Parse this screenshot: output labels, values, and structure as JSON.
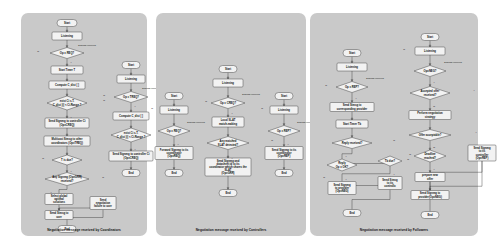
{
  "figure": {
    "background_color": "#ffffff",
    "panel_color": "#c9c9c9",
    "node_fill": "#f2f2f2",
    "node_stroke": "#3a3a3a"
  },
  "panels": [
    {
      "id": "coordinators",
      "caption": "Negotiation message received by Coordinators",
      "flows": [
        {
          "id": "coordinator-main",
          "nodes": [
            {
              "id": "c0",
              "type": "start",
              "label": "Start",
              "x": 46,
              "y": 10,
              "w": 20,
              "h": 7
            },
            {
              "id": "c1",
              "type": "process",
              "label": "Listening",
              "x": 46,
              "y": 23,
              "w": 30,
              "h": 8
            },
            {
              "id": "c2",
              "type": "decision",
              "label": "Op = REQ?",
              "x": 46,
              "y": 40,
              "w": 34,
              "h": 11
            },
            {
              "id": "c3",
              "type": "process",
              "label": "Start Timer T",
              "x": 46,
              "y": 57,
              "w": 32,
              "h": 8
            },
            {
              "id": "c4",
              "type": "process",
              "label": "Compute C_dist [ ]",
              "x": 46,
              "y": 72,
              "w": 36,
              "h": 8
            },
            {
              "id": "c5",
              "type": "decision",
              "label": "exist Ci s.T.\\nC_dist [i] < Ci.Range ?",
              "x": 46,
              "y": 90,
              "w": 40,
              "h": 14
            },
            {
              "id": "c6",
              "type": "process",
              "label": "Send Signmg to controller Ci\\n(Op=CREQ)",
              "x": 46,
              "y": 110,
              "w": 44,
              "h": 10
            },
            {
              "id": "c7",
              "type": "process",
              "label": "Multicast Simsg to other\\ncoordinators (Op=TREQ)",
              "x": 46,
              "y": 128,
              "w": 46,
              "h": 10
            },
            {
              "id": "c8",
              "type": "decision",
              "label": "T is due?",
              "x": 46,
              "y": 147,
              "w": 30,
              "h": 10
            },
            {
              "id": "c9",
              "type": "decision",
              "label": "Any Signmg (Op=GRR)\\nreceived?",
              "x": 46,
              "y": 166,
              "w": 44,
              "h": 13
            },
            {
              "id": "c10",
              "type": "process",
              "label": "Select global\\noptimal\\nsolutions",
              "x": 38,
              "y": 186,
              "w": 28,
              "h": 11
            },
            {
              "id": "c11",
              "type": "process",
              "label": "Send Simsg to\\nuser",
              "x": 38,
              "y": 202,
              "w": 28,
              "h": 9
            },
            {
              "id": "c12",
              "type": "process",
              "label": "Send\\nnegotiation\\nfailure to user",
              "x": 82,
              "y": 190,
              "w": 26,
              "h": 13
            },
            {
              "id": "c13",
              "type": "end",
              "label": "End",
              "x": 46,
              "y": 216,
              "w": 18,
              "h": 7
            }
          ],
          "edge_labels": [
            {
              "text": "Signmg received",
              "x": 66,
              "y": 33
            },
            {
              "text": "N",
              "x": 17,
              "y": 39
            },
            {
              "text": "Y",
              "x": 50,
              "y": 50
            },
            {
              "text": "Y",
              "x": 50,
              "y": 105
            },
            {
              "text": "N",
              "x": 83,
              "y": 88
            },
            {
              "text": "N",
              "x": 22,
              "y": 146
            },
            {
              "text": "Y",
              "x": 50,
              "y": 159
            },
            {
              "text": "Y",
              "x": 30,
              "y": 180
            },
            {
              "text": "N",
              "x": 82,
              "y": 165
            }
          ]
        },
        {
          "id": "coordinator-secondary",
          "nodes": [
            {
              "id": "d0",
              "type": "start",
              "label": "Start",
              "x": 110,
              "y": 52,
              "w": 18,
              "h": 7
            },
            {
              "id": "d1",
              "type": "process",
              "label": "Listening",
              "x": 110,
              "y": 66,
              "w": 28,
              "h": 8
            },
            {
              "id": "d2",
              "type": "decision",
              "label": "Op = TREQ?",
              "x": 110,
              "y": 84,
              "w": 34,
              "h": 11
            },
            {
              "id": "d3",
              "type": "process",
              "label": "Compute C_dist [ ]",
              "x": 110,
              "y": 103,
              "w": 36,
              "h": 8
            },
            {
              "id": "d4",
              "type": "decision",
              "label": "exist Ci s.T.\\nC_dist [i] < Ci.Range ?",
              "x": 110,
              "y": 122,
              "w": 40,
              "h": 14
            },
            {
              "id": "d5",
              "type": "process",
              "label": "Send Signmg to controller Ci\\n(Op=CREQ)",
              "x": 110,
              "y": 143,
              "w": 44,
              "h": 10
            },
            {
              "id": "d6",
              "type": "end",
              "label": "End",
              "x": 110,
              "y": 160,
              "w": 18,
              "h": 7
            }
          ],
          "edge_labels": [
            {
              "text": "Signmg received",
              "x": 130,
              "y": 76
            },
            {
              "text": "N",
              "x": 83,
              "y": 83
            },
            {
              "text": "Y",
              "x": 114,
              "y": 94
            },
            {
              "text": "Y",
              "x": 114,
              "y": 137
            },
            {
              "text": "N",
              "x": 146,
              "y": 120
            }
          ]
        }
      ]
    },
    {
      "id": "controllers",
      "caption": "Negotiation message received by Controllers",
      "flows": [
        {
          "id": "controller-left",
          "nodes": [
            {
              "id": "e0",
              "type": "start",
              "label": "Start",
              "x": 18,
              "y": 83,
              "w": 18,
              "h": 7
            },
            {
              "id": "e1",
              "type": "process",
              "label": "Listening",
              "x": 18,
              "y": 97,
              "w": 28,
              "h": 8
            },
            {
              "id": "e2",
              "type": "decision",
              "label": "Op = REQ?",
              "x": 18,
              "y": 118,
              "w": 32,
              "h": 11
            },
            {
              "id": "e3",
              "type": "process",
              "label": "Forward Signmg to its\\ncoordinator\\n(Op=REQ)",
              "x": 18,
              "y": 140,
              "w": 38,
              "h": 13
            },
            {
              "id": "e4",
              "type": "end",
              "label": "End",
              "x": 18,
              "y": 160,
              "w": 18,
              "h": 7
            }
          ],
          "edge_labels": [
            {
              "text": "Signmg received",
              "x": 40,
              "y": 110
            },
            {
              "text": "N",
              "x": -4,
              "y": 96
            },
            {
              "text": "Y",
              "x": 22,
              "y": 132
            }
          ]
        },
        {
          "id": "controller-center",
          "nodes": [
            {
              "id": "f0",
              "type": "start",
              "label": "Start",
              "x": 72,
              "y": 56,
              "w": 18,
              "h": 7
            },
            {
              "id": "f1",
              "type": "process",
              "label": "Listening",
              "x": 72,
              "y": 70,
              "w": 30,
              "h": 8
            },
            {
              "id": "f2",
              "type": "decision",
              "label": "Op = CREQ?",
              "x": 72,
              "y": 90,
              "w": 34,
              "h": 11
            },
            {
              "id": "f3",
              "type": "process",
              "label": "Local SLAT\\nmatch-making",
              "x": 72,
              "y": 109,
              "w": 32,
              "h": 10
            },
            {
              "id": "f4",
              "type": "decision",
              "label": "Any matched\\nSLAT detected?",
              "x": 72,
              "y": 130,
              "w": 42,
              "h": 13
            },
            {
              "id": "f5",
              "type": "process",
              "label": "Send Signmg and\\ndatasheet id to its\\ncoordinator which shares the\\nSLAT\\n(Op=GRR)",
              "x": 72,
              "y": 154,
              "w": 46,
              "h": 18
            },
            {
              "id": "f6",
              "type": "end",
              "label": "End",
              "x": 72,
              "y": 180,
              "w": 18,
              "h": 7
            }
          ],
          "edge_labels": [
            {
              "text": "Signmg received",
              "x": 95,
              "y": 82
            },
            {
              "text": "N",
              "x": 50,
              "y": 89
            },
            {
              "text": "Y",
              "x": 76,
              "y": 101
            },
            {
              "text": "Y",
              "x": 76,
              "y": 146
            },
            {
              "text": "N",
              "x": 116,
              "y": 128
            }
          ]
        },
        {
          "id": "controller-right",
          "nodes": [
            {
              "id": "g0",
              "type": "start",
              "label": "Start",
              "x": 128,
              "y": 83,
              "w": 18,
              "h": 7
            },
            {
              "id": "g1",
              "type": "process",
              "label": "Listening",
              "x": 128,
              "y": 97,
              "w": 28,
              "h": 8
            },
            {
              "id": "g2",
              "type": "decision",
              "label": "Op = REP?",
              "x": 128,
              "y": 118,
              "w": 32,
              "h": 11
            },
            {
              "id": "g3",
              "type": "process",
              "label": "Send Signmg to its\\ncoordinator\\n(Op=REP)",
              "x": 128,
              "y": 140,
              "w": 38,
              "h": 13
            },
            {
              "id": "g4",
              "type": "end",
              "label": "End",
              "x": 128,
              "y": 160,
              "w": 18,
              "h": 7
            }
          ],
          "edge_labels": [
            {
              "text": "Signmg received",
              "x": 150,
              "y": 110
            },
            {
              "text": "N",
              "x": 106,
              "y": 96
            },
            {
              "text": "Y",
              "x": 132,
              "y": 132
            }
          ]
        }
      ]
    },
    {
      "id": "followers",
      "caption": "Negotiation message received by Followers",
      "flows": [
        {
          "id": "follower-left",
          "nodes": [
            {
              "id": "h0",
              "type": "start",
              "label": "Start",
              "x": 42,
              "y": 40,
              "w": 18,
              "h": 7
            },
            {
              "id": "h1",
              "type": "process",
              "label": "Listening",
              "x": 42,
              "y": 54,
              "w": 30,
              "h": 8
            },
            {
              "id": "h2",
              "type": "decision",
              "label": "Op = REP?",
              "x": 42,
              "y": 74,
              "w": 32,
              "h": 11
            },
            {
              "id": "h3",
              "type": "process",
              "label": "Send Simsg to\\ncorresponding provider",
              "x": 42,
              "y": 94,
              "w": 44,
              "h": 9
            },
            {
              "id": "h4",
              "type": "process",
              "label": "Start Timer Tb",
              "x": 42,
              "y": 111,
              "w": 32,
              "h": 8
            },
            {
              "id": "h5",
              "type": "decision",
              "label": "Reply received?",
              "x": 42,
              "y": 130,
              "w": 40,
              "h": 11
            },
            {
              "id": "h6",
              "type": "decision",
              "label": "Reply\\nOp = OK?",
              "x": 32,
              "y": 152,
              "w": 30,
              "h": 12
            },
            {
              "id": "h7",
              "type": "decision",
              "label": "Tb due?",
              "x": 80,
              "y": 148,
              "w": 24,
              "h": 10
            },
            {
              "id": "h8",
              "type": "process",
              "label": "Send Signmg\\nto provider\\n(Op=NEG)",
              "x": 32,
              "y": 175,
              "w": 28,
              "h": 13
            },
            {
              "id": "h9",
              "type": "process",
              "label": "Send Simsg\\nto its\\ncontrollo",
              "x": 80,
              "y": 170,
              "w": 24,
              "h": 13
            },
            {
              "id": "h10",
              "type": "end",
              "label": "End",
              "x": 42,
              "y": 200,
              "w": 18,
              "h": 7
            }
          ],
          "edge_labels": [
            {
              "text": "Signmg received",
              "x": 65,
              "y": 66
            },
            {
              "text": "N",
              "x": 16,
              "y": 73
            },
            {
              "text": "Y",
              "x": 46,
              "y": 86
            },
            {
              "text": "Y",
              "x": 36,
              "y": 144
            },
            {
              "text": "N",
              "x": 84,
              "y": 128
            },
            {
              "text": "N",
              "x": 14,
              "y": 165
            },
            {
              "text": "Y",
              "x": 36,
              "y": 167
            },
            {
              "text": "Y",
              "x": 84,
              "y": 162
            },
            {
              "text": "N",
              "x": 98,
              "y": 147
            }
          ]
        },
        {
          "id": "follower-right",
          "nodes": [
            {
              "id": "k0",
              "type": "start",
              "label": "Start",
              "x": 120,
              "y": 24,
              "w": 18,
              "h": 7
            },
            {
              "id": "k1",
              "type": "process",
              "label": "Listening",
              "x": 120,
              "y": 38,
              "w": 30,
              "h": 8
            },
            {
              "id": "k2",
              "type": "decision",
              "label": "Op=NEG?",
              "x": 120,
              "y": 58,
              "w": 32,
              "h": 11
            },
            {
              "id": "k3",
              "type": "decision",
              "label": "Accepted offer\\nreceived?",
              "x": 120,
              "y": 80,
              "w": 40,
              "h": 13
            },
            {
              "id": "k4",
              "type": "process",
              "label": "Perform negotiation\\nstrategy",
              "x": 120,
              "y": 102,
              "w": 42,
              "h": 9
            },
            {
              "id": "k5",
              "type": "decision",
              "label": "Offer acceptable?",
              "x": 120,
              "y": 122,
              "w": 42,
              "h": 11
            },
            {
              "id": "k6",
              "type": "decision",
              "label": "Deadline\\nreached?",
              "x": 120,
              "y": 143,
              "w": 32,
              "h": 12
            },
            {
              "id": "k7",
              "type": "process",
              "label": "prepare new\\noffer",
              "x": 120,
              "y": 164,
              "w": 30,
              "h": 9
            },
            {
              "id": "k8",
              "type": "process",
              "label": "Send Signmg to\\nprovider(Op=NEG)",
              "x": 120,
              "y": 182,
              "w": 38,
              "h": 9
            },
            {
              "id": "k9",
              "type": "process",
              "label": "Send Signmg\\nto its\\ncontroller\\n(Op=REP)",
              "x": 172,
              "y": 140,
              "w": 28,
              "h": 16
            },
            {
              "id": "k10",
              "type": "end",
              "label": "End",
              "x": 120,
              "y": 202,
              "w": 18,
              "h": 7
            }
          ],
          "edge_labels": [
            {
              "text": "Signmg received",
              "x": 143,
              "y": 50
            },
            {
              "text": "N",
              "x": 94,
              "y": 37
            },
            {
              "text": "Y",
              "x": 124,
              "y": 70
            },
            {
              "text": "N",
              "x": 124,
              "y": 94
            },
            {
              "text": "Y",
              "x": 164,
              "y": 78
            },
            {
              "text": "N",
              "x": 124,
              "y": 135
            },
            {
              "text": "Y",
              "x": 166,
              "y": 120
            },
            {
              "text": "N",
              "x": 100,
              "y": 142
            },
            {
              "text": "Y",
              "x": 124,
              "y": 157
            }
          ]
        }
      ]
    }
  ]
}
